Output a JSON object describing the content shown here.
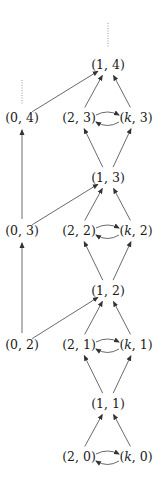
{
  "diagram": {
    "nodes": [
      {
        "id": "n14",
        "label": "(1, 4)",
        "x": 108,
        "y": 65
      },
      {
        "id": "n04",
        "label": "(0, 4)",
        "x": 22,
        "y": 118
      },
      {
        "id": "n23",
        "label": "(2, 3)",
        "x": 79,
        "y": 118
      },
      {
        "id": "nk3",
        "label": "(k, 3)",
        "x": 136,
        "y": 118
      },
      {
        "id": "n13",
        "label": "(1, 3)",
        "x": 108,
        "y": 178
      },
      {
        "id": "n03",
        "label": "(0, 3)",
        "x": 22,
        "y": 231
      },
      {
        "id": "n22",
        "label": "(2, 2)",
        "x": 79,
        "y": 231
      },
      {
        "id": "nk2",
        "label": "(k, 2)",
        "x": 136,
        "y": 231
      },
      {
        "id": "n12",
        "label": "(1, 2)",
        "x": 108,
        "y": 291
      },
      {
        "id": "n02",
        "label": "(0, 2)",
        "x": 22,
        "y": 345
      },
      {
        "id": "n21",
        "label": "(2, 1)",
        "x": 79,
        "y": 345
      },
      {
        "id": "nk1",
        "label": "(k, 1)",
        "x": 136,
        "y": 345
      },
      {
        "id": "n11",
        "label": "(1, 1)",
        "x": 108,
        "y": 404
      },
      {
        "id": "n20",
        "label": "(2, 0)",
        "x": 79,
        "y": 457
      },
      {
        "id": "nk0",
        "label": "(k, 0)",
        "x": 136,
        "y": 457
      }
    ],
    "edges": [
      {
        "from": "n04",
        "to": "n14"
      },
      {
        "from": "n23",
        "to": "n14"
      },
      {
        "from": "nk3",
        "to": "n14"
      },
      {
        "from": "n23",
        "to": "nk3",
        "curved": "top"
      },
      {
        "from": "nk3",
        "to": "n23",
        "curved": "bottom"
      },
      {
        "from": "n03",
        "to": "n04"
      },
      {
        "from": "n03",
        "to": "n13"
      },
      {
        "from": "n13",
        "to": "n23"
      },
      {
        "from": "n13",
        "to": "nk3"
      },
      {
        "from": "n22",
        "to": "n13"
      },
      {
        "from": "nk2",
        "to": "n13"
      },
      {
        "from": "n22",
        "to": "nk2",
        "curved": "top"
      },
      {
        "from": "nk2",
        "to": "n22",
        "curved": "bottom"
      },
      {
        "from": "n02",
        "to": "n03"
      },
      {
        "from": "n02",
        "to": "n12"
      },
      {
        "from": "n12",
        "to": "n22"
      },
      {
        "from": "n12",
        "to": "nk2"
      },
      {
        "from": "n21",
        "to": "n12"
      },
      {
        "from": "nk1",
        "to": "n12"
      },
      {
        "from": "n21",
        "to": "nk1",
        "curved": "top"
      },
      {
        "from": "nk1",
        "to": "n21",
        "curved": "bottom"
      },
      {
        "from": "n11",
        "to": "n21"
      },
      {
        "from": "n11",
        "to": "nk1"
      },
      {
        "from": "n20",
        "to": "n11"
      },
      {
        "from": "nk0",
        "to": "n11"
      },
      {
        "from": "n20",
        "to": "nk0",
        "curved": "top"
      },
      {
        "from": "nk0",
        "to": "n20",
        "curved": "bottom"
      }
    ],
    "dotted_continuations": [
      {
        "above": "n14"
      },
      {
        "above": "n04"
      }
    ]
  }
}
